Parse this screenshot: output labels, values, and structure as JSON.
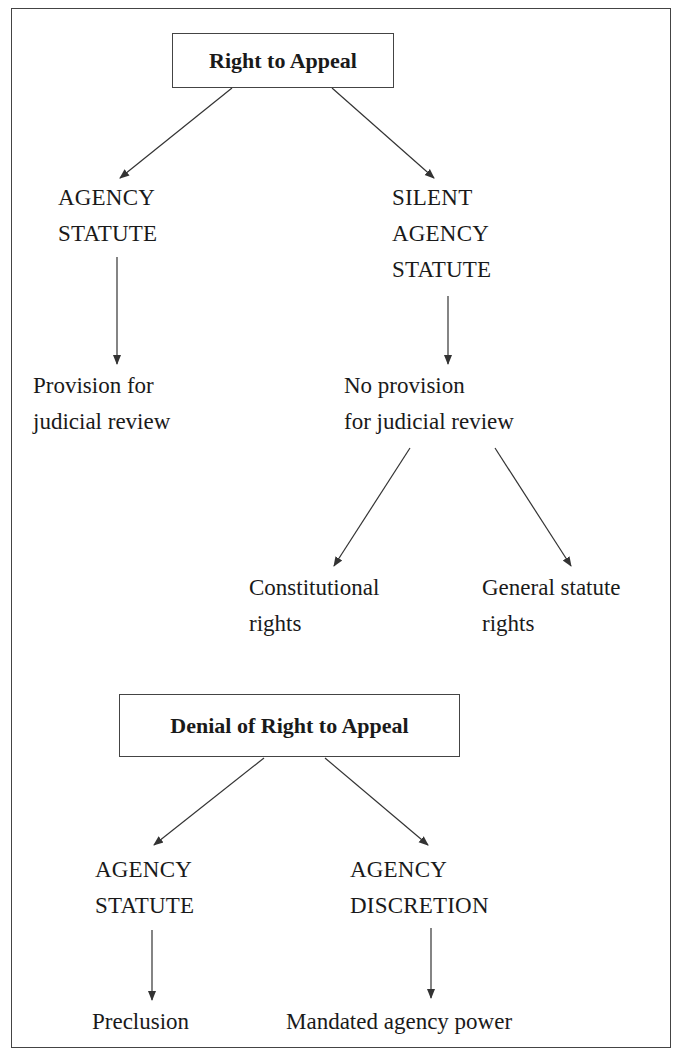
{
  "diagram": {
    "section1": {
      "title": "Right to Appeal",
      "left": {
        "line1": "AGENCY",
        "line2": "STATUTE",
        "outcome": {
          "line1": "Provision for",
          "line2": "judicial review"
        }
      },
      "right": {
        "line1": "SILENT",
        "line2": "AGENCY",
        "line3": "STATUTE",
        "outcome": {
          "line1": "No provision",
          "line2": "for judicial review"
        },
        "children": [
          {
            "line1": "Constitutional",
            "line2": "rights"
          },
          {
            "line1": "General statute",
            "line2": "rights"
          }
        ]
      }
    },
    "section2": {
      "title": "Denial of Right to Appeal",
      "left": {
        "line1": "AGENCY",
        "line2": "STATUTE",
        "outcome": "Preclusion"
      },
      "right": {
        "line1": "AGENCY",
        "line2": "DISCRETION",
        "outcome": "Mandated agency power"
      }
    },
    "colors": {
      "line": "#333333",
      "text": "#1a1a1a",
      "border": "#444444"
    }
  }
}
